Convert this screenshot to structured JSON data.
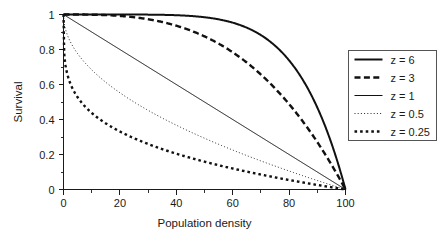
{
  "chart_data": {
    "type": "line",
    "title": "",
    "xlabel": "Population density",
    "ylabel": "Survival",
    "xlim": [
      0,
      100
    ],
    "ylim": [
      0,
      1
    ],
    "grid": false,
    "legend_position": "right-outside",
    "formula": "S = 1 - (x/100)^z",
    "x_ticks": [
      0,
      20,
      40,
      60,
      80,
      100
    ],
    "x_tick_labels": [
      "0",
      "20",
      "40",
      "60",
      "80",
      "100"
    ],
    "x_minor_ticks": [
      10,
      30,
      50,
      70,
      90
    ],
    "y_ticks": [
      0,
      0.2,
      0.4,
      0.6,
      0.8,
      1
    ],
    "y_tick_labels": [
      "0",
      "0.2",
      "0.4",
      "0.6",
      "0.8",
      "1"
    ],
    "y_minor_ticks": [
      0.1,
      0.3,
      0.5,
      0.7,
      0.9
    ],
    "x": [
      0,
      5,
      10,
      15,
      20,
      25,
      30,
      35,
      40,
      45,
      50,
      55,
      60,
      65,
      70,
      75,
      80,
      85,
      90,
      95,
      100
    ],
    "series": [
      {
        "name": "z = 6",
        "z": 6,
        "style": "solid",
        "width": 2.0,
        "values": [
          1,
          1,
          1,
          0.99999,
          0.99994,
          0.99976,
          0.99927,
          0.9982,
          0.9959,
          0.99169,
          0.98438,
          0.97234,
          0.95334,
          0.92453,
          0.88235,
          0.82202,
          0.73786,
          0.62282,
          0.46856,
          0.26492,
          0
        ]
      },
      {
        "name": "z = 3",
        "z": 3,
        "style": "dashed",
        "width": 2.4,
        "values": [
          1,
          0.99988,
          0.999,
          0.99663,
          0.992,
          0.98438,
          0.973,
          0.95713,
          0.936,
          0.90888,
          0.875,
          0.83363,
          0.784,
          0.72538,
          0.657,
          0.57813,
          0.488,
          0.38588,
          0.271,
          0.14263,
          0
        ]
      },
      {
        "name": "z = 1",
        "z": 1,
        "style": "solid",
        "width": 1.0,
        "values": [
          1,
          0.95,
          0.9,
          0.85,
          0.8,
          0.75,
          0.7,
          0.65,
          0.6,
          0.55,
          0.5,
          0.45,
          0.4,
          0.35,
          0.3,
          0.25,
          0.2,
          0.15,
          0.1,
          0.05,
          0
        ]
      },
      {
        "name": "z = 0.5",
        "z": 0.5,
        "style": "dotted-fine",
        "width": 0.9,
        "values": [
          1,
          0.77639,
          0.68377,
          0.6127,
          0.55279,
          0.5,
          0.45228,
          0.40836,
          0.36754,
          0.32918,
          0.29289,
          0.25838,
          0.2254,
          0.19377,
          0.16334,
          0.13397,
          0.10557,
          0.07804,
          0.05132,
          0.02532,
          0
        ]
      },
      {
        "name": "z = 0.25",
        "z": 0.25,
        "style": "dotted-thick",
        "width": 2.4,
        "values": [
          1,
          0.52709,
          0.43766,
          0.37767,
          0.33126,
          0.29289,
          0.25992,
          0.23083,
          0.20468,
          0.18083,
          0.1591,
          0.13849,
          0.11953,
          0.10165,
          0.08477,
          0.06877,
          0.0536,
          0.03918,
          0.02546,
          0.0124,
          0
        ]
      }
    ]
  },
  "legend": {
    "items": [
      {
        "label": "z = 6"
      },
      {
        "label": "z = 3"
      },
      {
        "label": "z = 1"
      },
      {
        "label": "z = 0.5"
      },
      {
        "label": "z = 0.25"
      }
    ]
  },
  "colors": {
    "line": "#111111",
    "axis": "#1a1a1a",
    "legend_border": "#555555",
    "background": "#ffffff"
  }
}
